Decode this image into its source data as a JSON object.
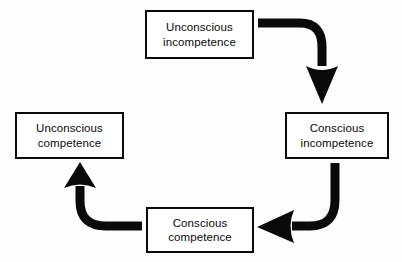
{
  "diagram": {
    "background_color": "#fdfdfd",
    "stroke_color": "#0a0a0a",
    "box_fill_color": "#ffffff",
    "nodes": [
      {
        "id": "unconscious-incompetence",
        "line1": "Unconscious",
        "line2": "incompetence",
        "position": "top"
      },
      {
        "id": "conscious-incompetence",
        "line1": "Conscious",
        "line2": "incompetence",
        "position": "right"
      },
      {
        "id": "conscious-competence",
        "line1": "Conscious",
        "line2": "competence",
        "position": "bottom"
      },
      {
        "id": "unconscious-competence",
        "line1": "Unconscious",
        "line2": "competence",
        "position": "left"
      }
    ],
    "arrows": [
      {
        "id": "arrow-top-to-right",
        "from": "unconscious-incompetence",
        "to": "conscious-incompetence",
        "direction": "down",
        "shape": "elbow-curved"
      },
      {
        "id": "arrow-right-to-bottom",
        "from": "conscious-incompetence",
        "to": "conscious-competence",
        "direction": "left",
        "shape": "elbow-curved"
      },
      {
        "id": "arrow-bottom-to-left",
        "from": "conscious-competence",
        "to": "unconscious-competence",
        "direction": "up",
        "shape": "elbow-curved"
      }
    ]
  }
}
